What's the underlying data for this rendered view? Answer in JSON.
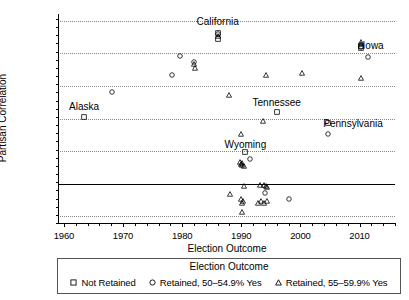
{
  "chart_data": {
    "type": "scatter",
    "title": "",
    "xlabel": "Election Outcome",
    "ylabel": "Partisan Correlation",
    "xlim": [
      1959,
      2016
    ],
    "ylim": [
      -0.24,
      1.04
    ],
    "xticks": [
      1960,
      1970,
      1980,
      1990,
      2000,
      2010
    ],
    "xtick_labels": [
      "1960",
      "1970",
      "1980",
      "1990",
      "2000",
      "2010"
    ],
    "x_minor_step": 2,
    "yticks": [
      -0.2,
      0.0,
      0.2,
      0.4,
      0.6,
      0.8,
      1.0
    ],
    "ytick_labels": [
      "-.2",
      ".0",
      ".2",
      ".4",
      ".6",
      ".8",
      "1.0"
    ],
    "y_minor_step": 0.05,
    "grid": "horizontal-dotted",
    "zero_line": 0.0,
    "legend_position": "bottom",
    "legend_title": "Election Outcome",
    "series": [
      {
        "name": "Not Retained",
        "marker": "square",
        "points": [
          {
            "x": 1963.4,
            "y": 0.41
          },
          {
            "x": 1986.0,
            "y": 0.925
          },
          {
            "x": 1986.0,
            "y": 0.885
          },
          {
            "x": 1996.0,
            "y": 0.44
          },
          {
            "x": 1990.7,
            "y": 0.195
          },
          {
            "x": 2010.2,
            "y": 0.845
          },
          {
            "x": 2010.2,
            "y": 0.83
          },
          {
            "x": 2004.6,
            "y": 0.375
          }
        ]
      },
      {
        "name": "Retained, 50–54.9% Yes",
        "marker": "circle",
        "points": [
          {
            "x": 1968.2,
            "y": 0.56
          },
          {
            "x": 1978.3,
            "y": 0.665
          },
          {
            "x": 1979.6,
            "y": 0.78
          },
          {
            "x": 1982.0,
            "y": 0.745
          },
          {
            "x": 1986.0,
            "y": 0.915
          },
          {
            "x": 1991.4,
            "y": 0.15
          },
          {
            "x": 1994.0,
            "y": -0.055
          },
          {
            "x": 1998.0,
            "y": -0.095
          },
          {
            "x": 2004.6,
            "y": 0.305
          },
          {
            "x": 2011.4,
            "y": 0.775
          },
          {
            "x": 2010.2,
            "y": 0.84
          }
        ]
      },
      {
        "name": "Retained, 55–59.9% Yes",
        "marker": "triangle",
        "points": [
          {
            "x": 1982.0,
            "y": 0.735
          },
          {
            "x": 1982.1,
            "y": 0.71
          },
          {
            "x": 1986.0,
            "y": 0.905
          },
          {
            "x": 1988.0,
            "y": 0.545
          },
          {
            "x": 1990.0,
            "y": 0.305
          },
          {
            "x": 1993.7,
            "y": 0.385
          },
          {
            "x": 1994.1,
            "y": 0.665
          },
          {
            "x": 2000.2,
            "y": 0.68
          },
          {
            "x": 2010.2,
            "y": 0.87
          },
          {
            "x": 2010.2,
            "y": 0.855
          },
          {
            "x": 2010.3,
            "y": 0.645
          },
          {
            "x": 1989.8,
            "y": 0.135
          },
          {
            "x": 1990.1,
            "y": 0.125
          },
          {
            "x": 1989.9,
            "y": 0.12
          },
          {
            "x": 1990.2,
            "y": 0.115
          },
          {
            "x": 1990.4,
            "y": 0.11
          },
          {
            "x": 1990.5,
            "y": -0.015
          },
          {
            "x": 1993.2,
            "y": -0.005
          },
          {
            "x": 1993.9,
            "y": -0.005
          },
          {
            "x": 1994.2,
            "y": -0.012
          },
          {
            "x": 1994.4,
            "y": -0.018
          },
          {
            "x": 1988.1,
            "y": -0.065
          },
          {
            "x": 1990.0,
            "y": -0.095
          },
          {
            "x": 1990.3,
            "y": -0.105
          },
          {
            "x": 1990.1,
            "y": -0.12
          },
          {
            "x": 1990.2,
            "y": -0.175
          },
          {
            "x": 1993.3,
            "y": -0.105
          },
          {
            "x": 1993.9,
            "y": -0.115
          },
          {
            "x": 1994.3,
            "y": -0.105
          },
          {
            "x": 1992.8,
            "y": -0.115
          }
        ]
      }
    ],
    "annotations": [
      {
        "label": "California",
        "x": 1986.0,
        "y": 1.0
      },
      {
        "label": "Iowa",
        "x": 2012.3,
        "y": 0.85
      },
      {
        "label": "Alaska",
        "x": 1963.4,
        "y": 0.475
      },
      {
        "label": "Tennessee",
        "x": 1996.0,
        "y": 0.5
      },
      {
        "label": "Pennsylvania",
        "x": 2008.9,
        "y": 0.375
      },
      {
        "label": "Wyoming",
        "x": 1990.7,
        "y": 0.245
      }
    ]
  }
}
